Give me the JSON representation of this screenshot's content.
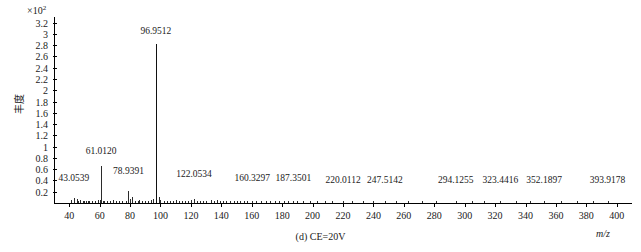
{
  "chart_data": {
    "type": "bar",
    "title": "",
    "subtitle": "",
    "caption": "(d) CE=20V",
    "xlabel": "m/z",
    "ylabel": "丰度",
    "y_scale_prefix": "×10",
    "y_scale_exponent": "2",
    "xlim": [
      30,
      410
    ],
    "ylim": [
      0,
      3.3
    ],
    "grid": false,
    "legend": null,
    "xticks": [
      40,
      60,
      80,
      100,
      120,
      140,
      160,
      180,
      200,
      220,
      240,
      260,
      280,
      300,
      320,
      340,
      360,
      380,
      400
    ],
    "yticks": [
      "0.2",
      "0.4",
      "0.6",
      "0.8",
      "1",
      "1.2",
      "1.4",
      "1.6",
      "1.8",
      "2",
      "2.2",
      "2.4",
      "2.6",
      "2.8",
      "3",
      "3.2"
    ],
    "ytick_values": [
      0.2,
      0.4,
      0.6,
      0.8,
      1.0,
      1.2,
      1.4,
      1.6,
      1.8,
      2.0,
      2.2,
      2.4,
      2.6,
      2.8,
      3.0,
      3.2
    ],
    "annotations": [
      {
        "label": "43.0539",
        "mz": 43.0539,
        "y": 0.34
      },
      {
        "label": "61.0120",
        "mz": 61.012,
        "y": 0.82
      },
      {
        "label": "78.9391",
        "mz": 78.9391,
        "y": 0.46
      },
      {
        "label": "96.9512",
        "mz": 96.9512,
        "y": 2.95
      },
      {
        "label": "122.0534",
        "mz": 122.0534,
        "y": 0.4
      },
      {
        "label": "160.3297",
        "mz": 160.3297,
        "y": 0.34
      },
      {
        "label": "187.3501",
        "mz": 187.3501,
        "y": 0.34
      },
      {
        "label": "220.0112",
        "mz": 220.0112,
        "y": 0.3
      },
      {
        "label": "247.5142",
        "mz": 247.5142,
        "y": 0.3
      },
      {
        "label": "294.1255",
        "mz": 294.1255,
        "y": 0.3
      },
      {
        "label": "323.4416",
        "mz": 323.4416,
        "y": 0.3
      },
      {
        "label": "352.1897",
        "mz": 352.1897,
        "y": 0.3
      },
      {
        "label": "393.9178",
        "mz": 393.9178,
        "y": 0.3
      }
    ],
    "peaks": [
      {
        "mz": 96.9512,
        "intensity": 2.82
      },
      {
        "mz": 61.012,
        "intensity": 0.66
      },
      {
        "mz": 78.9391,
        "intensity": 0.22
      },
      {
        "mz": 80.965,
        "intensity": 0.11
      },
      {
        "mz": 43.0539,
        "intensity": 0.09
      },
      {
        "mz": 44.997,
        "intensity": 0.07
      },
      {
        "mz": 41.038,
        "intensity": 0.06
      },
      {
        "mz": 45.033,
        "intensity": 0.05
      },
      {
        "mz": 46.005,
        "intensity": 0.04
      },
      {
        "mz": 47.012,
        "intensity": 0.05
      },
      {
        "mz": 48.975,
        "intensity": 0.04
      },
      {
        "mz": 50.003,
        "intensity": 0.03
      },
      {
        "mz": 51.021,
        "intensity": 0.03
      },
      {
        "mz": 52.034,
        "intensity": 0.03
      },
      {
        "mz": 53.011,
        "intensity": 0.04
      },
      {
        "mz": 55.018,
        "intensity": 0.03
      },
      {
        "mz": 57.034,
        "intensity": 0.04
      },
      {
        "mz": 59.013,
        "intensity": 0.06
      },
      {
        "mz": 60.008,
        "intensity": 0.05
      },
      {
        "mz": 62.024,
        "intensity": 0.04
      },
      {
        "mz": 63.009,
        "intensity": 0.03
      },
      {
        "mz": 65.038,
        "intensity": 0.03
      },
      {
        "mz": 67.054,
        "intensity": 0.03
      },
      {
        "mz": 69.033,
        "intensity": 0.05
      },
      {
        "mz": 71.049,
        "intensity": 0.03
      },
      {
        "mz": 73.028,
        "intensity": 0.04
      },
      {
        "mz": 75.023,
        "intensity": 0.03
      },
      {
        "mz": 77.038,
        "intensity": 0.04
      },
      {
        "mz": 79.956,
        "intensity": 0.07
      },
      {
        "mz": 82.941,
        "intensity": 0.04
      },
      {
        "mz": 84.959,
        "intensity": 0.04
      },
      {
        "mz": 86.01,
        "intensity": 0.05
      },
      {
        "mz": 88.039,
        "intensity": 0.03
      },
      {
        "mz": 90.015,
        "intensity": 0.03
      },
      {
        "mz": 92.026,
        "intensity": 0.04
      },
      {
        "mz": 94.019,
        "intensity": 0.05
      },
      {
        "mz": 95.013,
        "intensity": 0.08
      },
      {
        "mz": 98.948,
        "intensity": 0.1
      },
      {
        "mz": 100.015,
        "intensity": 0.05
      },
      {
        "mz": 102.031,
        "intensity": 0.04
      },
      {
        "mz": 104.048,
        "intensity": 0.03
      },
      {
        "mz": 106.029,
        "intensity": 0.04
      },
      {
        "mz": 108.021,
        "intensity": 0.04
      },
      {
        "mz": 110.036,
        "intensity": 0.05
      },
      {
        "mz": 112.015,
        "intensity": 0.04
      },
      {
        "mz": 114.033,
        "intensity": 0.03
      },
      {
        "mz": 116.047,
        "intensity": 0.03
      },
      {
        "mz": 118.028,
        "intensity": 0.04
      },
      {
        "mz": 120.019,
        "intensity": 0.05
      },
      {
        "mz": 122.0534,
        "intensity": 0.07
      },
      {
        "mz": 124.031,
        "intensity": 0.04
      },
      {
        "mz": 126.044,
        "intensity": 0.03
      },
      {
        "mz": 128.025,
        "intensity": 0.04
      },
      {
        "mz": 130.039,
        "intensity": 0.03
      },
      {
        "mz": 133.014,
        "intensity": 0.05
      },
      {
        "mz": 135.027,
        "intensity": 0.04
      },
      {
        "mz": 137.046,
        "intensity": 0.06
      },
      {
        "mz": 139.033,
        "intensity": 0.04
      },
      {
        "mz": 141.021,
        "intensity": 0.03
      },
      {
        "mz": 143.05,
        "intensity": 0.03
      },
      {
        "mz": 146.034,
        "intensity": 0.04
      },
      {
        "mz": 148.026,
        "intensity": 0.03
      },
      {
        "mz": 150.041,
        "intensity": 0.03
      },
      {
        "mz": 152.019,
        "intensity": 0.04
      },
      {
        "mz": 155.032,
        "intensity": 0.03
      },
      {
        "mz": 157.048,
        "intensity": 0.03
      },
      {
        "mz": 160.3297,
        "intensity": 0.04
      },
      {
        "mz": 163.022,
        "intensity": 0.03
      },
      {
        "mz": 166.039,
        "intensity": 0.03
      },
      {
        "mz": 169.051,
        "intensity": 0.03
      },
      {
        "mz": 172.028,
        "intensity": 0.04
      },
      {
        "mz": 175.034,
        "intensity": 0.03
      },
      {
        "mz": 178.026,
        "intensity": 0.03
      },
      {
        "mz": 181.043,
        "intensity": 0.03
      },
      {
        "mz": 184.019,
        "intensity": 0.03
      },
      {
        "mz": 187.3501,
        "intensity": 0.04
      },
      {
        "mz": 190.035,
        "intensity": 0.03
      },
      {
        "mz": 194.022,
        "intensity": 0.03
      },
      {
        "mz": 198.048,
        "intensity": 0.03
      },
      {
        "mz": 203.031,
        "intensity": 0.03
      },
      {
        "mz": 208.026,
        "intensity": 0.03
      },
      {
        "mz": 213.044,
        "intensity": 0.03
      },
      {
        "mz": 220.0112,
        "intensity": 0.04
      },
      {
        "mz": 226.033,
        "intensity": 0.03
      },
      {
        "mz": 233.019,
        "intensity": 0.03
      },
      {
        "mz": 240.045,
        "intensity": 0.03
      },
      {
        "mz": 247.5142,
        "intensity": 0.03
      },
      {
        "mz": 255.028,
        "intensity": 0.03
      },
      {
        "mz": 263.036,
        "intensity": 0.03
      },
      {
        "mz": 272.021,
        "intensity": 0.03
      },
      {
        "mz": 281.049,
        "intensity": 0.03
      },
      {
        "mz": 294.1255,
        "intensity": 0.03
      },
      {
        "mz": 305.033,
        "intensity": 0.03
      },
      {
        "mz": 313.027,
        "intensity": 0.03
      },
      {
        "mz": 323.4416,
        "intensity": 0.03
      },
      {
        "mz": 334.041,
        "intensity": 0.03
      },
      {
        "mz": 343.022,
        "intensity": 0.03
      },
      {
        "mz": 352.1897,
        "intensity": 0.03
      },
      {
        "mz": 363.034,
        "intensity": 0.03
      },
      {
        "mz": 374.026,
        "intensity": 0.03
      },
      {
        "mz": 384.048,
        "intensity": 0.03
      },
      {
        "mz": 393.9178,
        "intensity": 0.03
      }
    ]
  }
}
